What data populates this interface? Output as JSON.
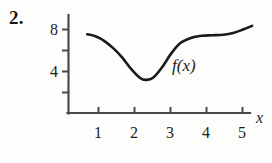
{
  "problem": {
    "number": "2."
  },
  "figure": {
    "curve_label": "f(x)",
    "axis_label_x": "x",
    "axis_color": "#4a4a4a",
    "curve_color": "#1a1a1a",
    "background": "#fdfdfc"
  },
  "chart_data": {
    "type": "line",
    "title": "",
    "subtitle": "",
    "xlabel": "x",
    "ylabel": "",
    "annotations": [
      "f(x)"
    ],
    "legend": [],
    "legend_position": "none",
    "grid": false,
    "xlim": [
      0,
      5.6
    ],
    "ylim": [
      0,
      9.4
    ],
    "xticks": [
      1,
      2,
      3,
      4,
      5
    ],
    "xtick_labels": [
      "1",
      "2",
      "3",
      "4",
      "5"
    ],
    "yticks": [
      2,
      4,
      6,
      8
    ],
    "ytick_labels": [
      "",
      "4",
      "",
      "8"
    ],
    "ytick_labels_shown": [
      "4",
      "8"
    ],
    "series": [
      {
        "name": "f(x)",
        "x": [
          0.52,
          0.75,
          1.0,
          1.25,
          1.5,
          1.75,
          2.0,
          2.15,
          2.35,
          2.6,
          2.85,
          3.1,
          3.4,
          3.7,
          4.0,
          4.3,
          4.6,
          4.85,
          5.1
        ],
        "y": [
          7.55,
          7.35,
          6.9,
          6.2,
          5.3,
          4.2,
          3.35,
          3.2,
          3.4,
          4.4,
          5.7,
          6.7,
          7.2,
          7.4,
          7.45,
          7.5,
          7.7,
          8.0,
          8.35
        ]
      }
    ]
  }
}
